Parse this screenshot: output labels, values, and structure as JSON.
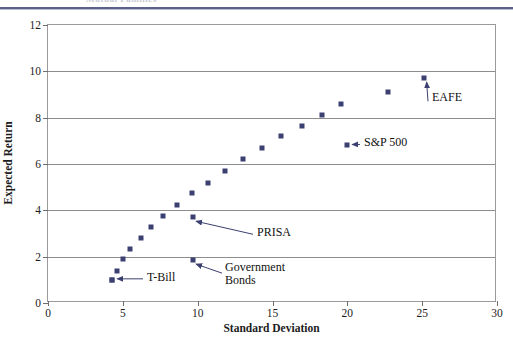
{
  "page": {
    "header_remnant_text": "Mutual  Families"
  },
  "chart_data": {
    "type": "scatter",
    "title": "",
    "xlabel": "Standard Deviation",
    "ylabel": "Expected Return",
    "xlim": [
      0,
      30
    ],
    "ylim": [
      0,
      12
    ],
    "xticks": [
      0,
      5,
      10,
      15,
      20,
      25,
      30
    ],
    "yticks": [
      0,
      2,
      4,
      6,
      8,
      10,
      12
    ],
    "grid": "horizontal",
    "legend": "none",
    "marker_color": "#3b4071",
    "series": [
      {
        "name": "Efficient frontier",
        "points": [
          {
            "x": 4.3,
            "y": 1.0
          },
          {
            "x": 4.6,
            "y": 1.4
          },
          {
            "x": 5.0,
            "y": 1.9
          },
          {
            "x": 5.5,
            "y": 2.35
          },
          {
            "x": 6.2,
            "y": 2.8
          },
          {
            "x": 6.9,
            "y": 3.3
          },
          {
            "x": 7.7,
            "y": 3.75
          },
          {
            "x": 8.6,
            "y": 4.25
          },
          {
            "x": 9.6,
            "y": 4.75
          },
          {
            "x": 10.7,
            "y": 5.2
          },
          {
            "x": 11.8,
            "y": 5.7
          },
          {
            "x": 13.0,
            "y": 6.2
          },
          {
            "x": 14.3,
            "y": 6.7
          },
          {
            "x": 15.6,
            "y": 7.2
          },
          {
            "x": 17.0,
            "y": 7.65
          },
          {
            "x": 18.3,
            "y": 8.1
          },
          {
            "x": 19.6,
            "y": 8.6
          },
          {
            "x": 22.7,
            "y": 9.1
          }
        ]
      },
      {
        "name": "Labeled assets",
        "points": [
          {
            "x": 4.3,
            "y": 1.0,
            "label": "T-Bill"
          },
          {
            "x": 9.7,
            "y": 1.85,
            "label": "Government Bonds"
          },
          {
            "x": 9.7,
            "y": 3.7,
            "label": "PRISA"
          },
          {
            "x": 20.0,
            "y": 6.8,
            "label": "S&P 500"
          },
          {
            "x": 25.1,
            "y": 9.7,
            "label": "EAFE"
          }
        ]
      }
    ],
    "annotations": [
      {
        "name": "t-bill-annotation",
        "text": "T-Bill",
        "point": [
          4.3,
          1.0
        ]
      },
      {
        "name": "gov-bonds-annotation",
        "text": "Government\nBonds",
        "point": [
          9.7,
          1.85
        ]
      },
      {
        "name": "prisa-annotation",
        "text": "PRISA",
        "point": [
          9.7,
          3.7
        ]
      },
      {
        "name": "sp500-annotation",
        "text": "S&P 500",
        "point": [
          20.0,
          6.8
        ]
      },
      {
        "name": "eafe-annotation",
        "text": "EAFE",
        "point": [
          25.1,
          9.7
        ]
      }
    ],
    "annotation_labels": {
      "t_bill": "T-Bill",
      "gov_bonds_line1": "Government",
      "gov_bonds_line2": "Bonds",
      "prisa": "PRISA",
      "sp500": "S&P 500",
      "eafe": "EAFE"
    }
  }
}
